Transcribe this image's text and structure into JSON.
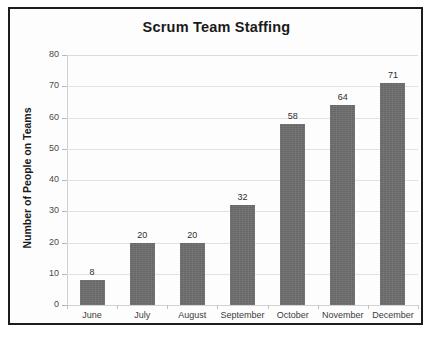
{
  "chart_data": {
    "type": "bar",
    "title": "Scrum Team Staffing",
    "xlabel": "",
    "ylabel": "Number of People on Teams",
    "categories": [
      "June",
      "July",
      "August",
      "September",
      "October",
      "November",
      "December"
    ],
    "values": [
      8,
      20,
      20,
      32,
      58,
      64,
      71
    ],
    "value_labels": [
      "8",
      "20",
      "20",
      "32",
      "58",
      "64",
      "71"
    ],
    "ylim": [
      0,
      80
    ],
    "ytick_values": [
      0,
      10,
      20,
      30,
      40,
      50,
      60,
      70,
      80
    ],
    "ytick_labels": [
      "0",
      "10",
      "20",
      "30",
      "40",
      "50",
      "60",
      "70",
      "80"
    ],
    "grid": true,
    "legend": false,
    "legend_position": "none",
    "series": [
      {
        "name": "Number of People on Teams",
        "values": [
          8,
          20,
          20,
          32,
          58,
          64,
          71
        ],
        "color": "#6e6e6e"
      }
    ],
    "colors": {
      "bar": "#6e6e6e",
      "gridline": "#e2e2e2",
      "frame": "#1c1c1c",
      "background": "#fdfdfd",
      "text": "#1a1a1a"
    }
  }
}
